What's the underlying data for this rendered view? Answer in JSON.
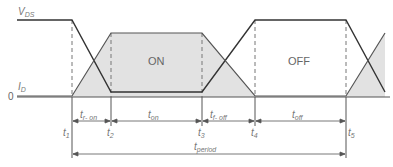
{
  "diagram": {
    "signals": {
      "vds": {
        "main": "V",
        "sub": "DS"
      },
      "id": {
        "main": "I",
        "sub": "D"
      },
      "zero": "0"
    },
    "states": {
      "on": "ON",
      "off": "OFF"
    },
    "time_points": [
      {
        "main": "t",
        "sub": "1"
      },
      {
        "main": "t",
        "sub": "2"
      },
      {
        "main": "t",
        "sub": "3"
      },
      {
        "main": "t",
        "sub": "4"
      },
      {
        "main": "t",
        "sub": "5"
      }
    ],
    "intervals": {
      "tr_on": {
        "main": "t",
        "sub": "r- on"
      },
      "t_on": {
        "main": "t",
        "sub": "on"
      },
      "tf_off": {
        "main": "t",
        "sub": "f- off"
      },
      "t_off": {
        "main": "t",
        "sub": "off"
      },
      "t_period": {
        "main": "t",
        "sub": "period"
      }
    },
    "colors": {
      "line": "#333333",
      "fill": "#e2e2e2",
      "dash": "#777777",
      "text": "#777777"
    }
  }
}
